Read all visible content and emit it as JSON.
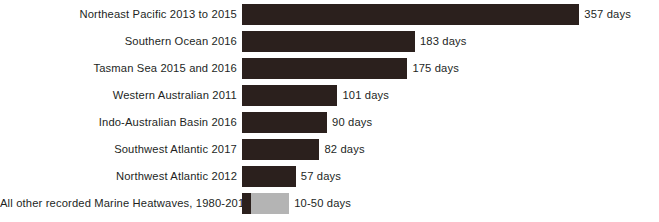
{
  "chart_data": {
    "type": "bar",
    "orientation": "horizontal",
    "title": "",
    "subtitle": "",
    "xlabel": "",
    "ylabel": "",
    "unit": "days",
    "grid": false,
    "legend": false,
    "axis_visible": false,
    "xlim": [
      0,
      380
    ],
    "categories": [
      "Northeast Pacific 2013 to 2015",
      "Southern Ocean 2016",
      "Tasman Sea 2015 and 2016",
      "Western Australian 2011",
      "Indo-Australian Basin 2016",
      "Southwest Atlantic 2017",
      "Northwest Atlantic 2012",
      "All other recorded Marine Heatwaves, 1980-2010"
    ],
    "values": [
      357,
      183,
      175,
      101,
      90,
      82,
      57,
      50
    ],
    "value_labels": [
      "357 days",
      "183 days",
      "175 days",
      "101 days",
      "90 days",
      "82 days",
      "57 days",
      "10-50 days"
    ],
    "colors": {
      "bar_dark": "#2b201d",
      "bar_light": "#b4b4b4",
      "text": "#231f1e",
      "background": "#ffffff"
    },
    "rows": [
      {
        "label": "Northeast Pacific 2013 to 2015",
        "value": 357,
        "value_label": "357 days",
        "range": false,
        "dark_value": 357,
        "light_value": 0
      },
      {
        "label": "Southern Ocean 2016",
        "value": 183,
        "value_label": "183 days",
        "range": false,
        "dark_value": 183,
        "light_value": 0
      },
      {
        "label": "Tasman Sea 2015 and 2016",
        "value": 175,
        "value_label": "175 days",
        "range": false,
        "dark_value": 175,
        "light_value": 0
      },
      {
        "label": "Western Australian 2011",
        "value": 101,
        "value_label": "101 days",
        "range": false,
        "dark_value": 101,
        "light_value": 0
      },
      {
        "label": "Indo-Australian Basin 2016",
        "value": 90,
        "value_label": "90 days",
        "range": false,
        "dark_value": 90,
        "light_value": 0
      },
      {
        "label": "Southwest Atlantic 2017",
        "value": 82,
        "value_label": "82 days",
        "range": false,
        "dark_value": 82,
        "light_value": 0
      },
      {
        "label": "Northwest Atlantic 2012",
        "value": 57,
        "value_label": "57 days",
        "range": false,
        "dark_value": 57,
        "light_value": 0
      },
      {
        "label": "All other recorded Marine Heatwaves, 1980-2010",
        "value": 50,
        "value_label": "10-50 days",
        "range": true,
        "range_min": 10,
        "range_max": 50,
        "dark_value": 10,
        "light_value": 40
      }
    ]
  }
}
